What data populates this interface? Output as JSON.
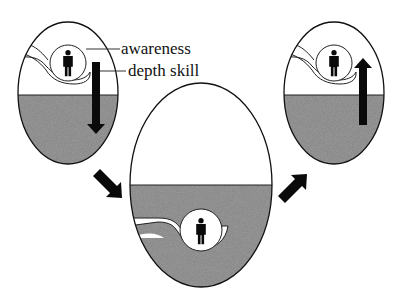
{
  "diagram": {
    "type": "three-stage flow",
    "labels": {
      "awareness": "awareness",
      "depth_skill": "depth skill"
    },
    "stages": [
      {
        "id": "surface",
        "description": "figure in awareness circle above water line, arrow pointing down",
        "arrow": "down"
      },
      {
        "id": "depth",
        "description": "figure in awareness circle submerged below water line"
      },
      {
        "id": "return",
        "description": "figure in awareness circle above water line, arrow pointing up",
        "arrow": "up"
      }
    ],
    "connectors": [
      "arrow-down-right",
      "arrow-up-right"
    ],
    "colors": {
      "water": "#7d7d7d",
      "outline": "#111111",
      "figure": "#0a0a0a",
      "background": "#ffffff"
    }
  }
}
